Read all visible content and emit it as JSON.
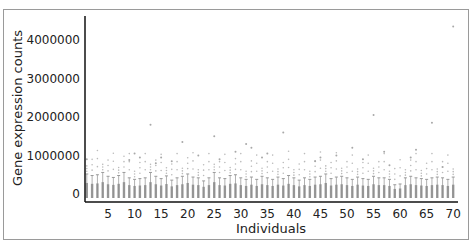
{
  "chart_data": {
    "type": "box",
    "title": "",
    "xlabel": "Individuals",
    "ylabel": "Gene expression counts",
    "x_ticks": [
      5,
      10,
      15,
      20,
      25,
      30,
      35,
      40,
      45,
      50,
      55,
      60,
      65,
      70
    ],
    "y_ticks": [
      0,
      1000000,
      2000000,
      3000000,
      4000000
    ],
    "y_tick_labels": [
      "0",
      "1000000",
      "2000000",
      "3000000",
      "4000000"
    ],
    "xlim": [
      0.5,
      70.5
    ],
    "ylim": [
      -150000,
      4600000
    ],
    "grid": false,
    "legend": null,
    "n_individuals": 70,
    "box_color": "#8a8a8a",
    "whisker_top": [
      520000,
      480000,
      500000,
      560000,
      460000,
      430000,
      480000,
      560000,
      420000,
      380000,
      400000,
      420000,
      560000,
      460000,
      400000,
      470000,
      360000,
      420000,
      460000,
      520000,
      440000,
      420000,
      340000,
      420000,
      560000,
      420000,
      400000,
      480000,
      500000,
      420000,
      380000,
      440000,
      380000,
      460000,
      420000,
      380000,
      440000,
      400000,
      480000,
      420000,
      360000,
      420000,
      380000,
      440000,
      460000,
      520000,
      400000,
      440000,
      460000,
      420000,
      380000,
      440000,
      400000,
      380000,
      460000,
      420000,
      420000,
      380000,
      240000,
      260000,
      420000,
      460000,
      420000,
      400000,
      380000,
      420000,
      440000,
      420000,
      380000,
      440000
    ],
    "outliers": [
      {
        "x": 1,
        "y": 900000
      },
      {
        "x": 9,
        "y": 880000
      },
      {
        "x": 10,
        "y": 1050000
      },
      {
        "x": 11,
        "y": 950000
      },
      {
        "x": 13,
        "y": 1800000
      },
      {
        "x": 14,
        "y": 800000
      },
      {
        "x": 15,
        "y": 950000
      },
      {
        "x": 17,
        "y": 850000
      },
      {
        "x": 19,
        "y": 1350000
      },
      {
        "x": 22,
        "y": 1000000
      },
      {
        "x": 25,
        "y": 1500000
      },
      {
        "x": 26,
        "y": 900000
      },
      {
        "x": 29,
        "y": 1100000
      },
      {
        "x": 31,
        "y": 1300000
      },
      {
        "x": 32,
        "y": 1200000
      },
      {
        "x": 34,
        "y": 950000
      },
      {
        "x": 35,
        "y": 1050000
      },
      {
        "x": 38,
        "y": 1600000
      },
      {
        "x": 44,
        "y": 850000
      },
      {
        "x": 45,
        "y": 950000
      },
      {
        "x": 48,
        "y": 1000000
      },
      {
        "x": 51,
        "y": 1200000
      },
      {
        "x": 53,
        "y": 900000
      },
      {
        "x": 55,
        "y": 2050000
      },
      {
        "x": 57,
        "y": 1100000
      },
      {
        "x": 58,
        "y": 750000
      },
      {
        "x": 62,
        "y": 950000
      },
      {
        "x": 63,
        "y": 1150000
      },
      {
        "x": 66,
        "y": 1850000
      },
      {
        "x": 68,
        "y": 700000
      },
      {
        "x": 70,
        "y": 4350000
      }
    ]
  }
}
